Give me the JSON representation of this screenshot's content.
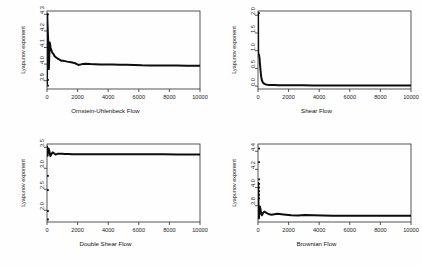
{
  "figure": {
    "layout": "2x2 grid of panels",
    "background_color": "#fefefe",
    "foreground_color": "#1a1a1a"
  },
  "chart_data": [
    {
      "type": "line",
      "title": "",
      "xlabel": "Ornstein-Uhlenbeck Flow",
      "ylabel": "Lyapunov exponent",
      "xlim": [
        0,
        10000
      ],
      "ylim": [
        3.85,
        4.32
      ],
      "xticks": [
        0,
        2000,
        4000,
        6000,
        8000,
        10000
      ],
      "xtick_labels": [
        "0",
        "2000",
        "4000",
        "6000",
        "8000",
        "10000"
      ],
      "yticks": [
        3.9,
        4.0,
        4.1,
        4.2,
        4.3
      ],
      "ytick_labels": [
        "3.9",
        "4.0",
        "4.1",
        "4.2",
        "4.3"
      ],
      "grid": false,
      "legend": "none",
      "x": [
        5,
        12,
        20,
        30,
        45,
        60,
        80,
        100,
        120,
        140,
        160,
        180,
        200,
        230,
        260,
        300,
        340,
        380,
        430,
        480,
        540,
        600,
        680,
        760,
        850,
        950,
        1060,
        1180,
        1320,
        1480,
        1650,
        1850,
        2050,
        2300,
        2550,
        2850,
        3150,
        3500,
        3900,
        4300,
        4750,
        5200,
        5700,
        6200,
        6750,
        7300,
        7900,
        8500,
        9100,
        9700,
        10000
      ],
      "y": [
        3.88,
        4.3,
        4.29,
        4.25,
        4.22,
        4.18,
        4.14,
        4.1,
        3.97,
        4.02,
        4.09,
        4.13,
        4.12,
        4.1,
        4.09,
        4.08,
        4.07,
        4.065,
        4.06,
        4.05,
        4.045,
        4.04,
        4.035,
        4.03,
        4.025,
        4.02,
        4.02,
        4.018,
        4.015,
        4.012,
        4.01,
        4.005,
        3.995,
        4.0,
        4.002,
        4.0,
        3.999,
        3.998,
        3.998,
        3.997,
        3.996,
        3.996,
        3.995,
        3.993,
        3.992,
        3.992,
        3.991,
        3.991,
        3.99,
        3.99,
        3.99
      ],
      "outlier_points": [
        {
          "x": 60,
          "y": 4.3
        },
        {
          "x": 62,
          "y": 3.905
        },
        {
          "x": 64,
          "y": 3.87
        }
      ],
      "description": "Running Lyapunov exponent estimate converging to about 3.99 after a transient spike near 4.3."
    },
    {
      "type": "line",
      "title": "",
      "xlabel": "Shear Flow",
      "ylabel": "Lyapunov exponent",
      "xlim": [
        0,
        10000
      ],
      "ylim": [
        -0.08,
        2.12
      ],
      "xticks": [
        0,
        2000,
        4000,
        6000,
        8000,
        10000
      ],
      "xtick_labels": [
        "0",
        "2000",
        "4000",
        "6000",
        "8000",
        "10000"
      ],
      "yticks": [
        0.0,
        0.5,
        1.0,
        1.5,
        2.0
      ],
      "ytick_labels": [
        "0.0",
        "0.5",
        "1.0",
        "1.5",
        "2.0"
      ],
      "grid": false,
      "legend": "none",
      "x": [
        5,
        15,
        30,
        50,
        75,
        100,
        130,
        170,
        210,
        260,
        320,
        400,
        500,
        620,
        760,
        920,
        1100,
        1320,
        1600,
        1950,
        2400,
        2950,
        3600,
        4300,
        5100,
        5900,
        6800,
        7700,
        8600,
        9400,
        10000
      ],
      "y": [
        2.06,
        0.93,
        0.92,
        0.9,
        0.86,
        0.78,
        0.62,
        0.42,
        0.26,
        0.16,
        0.1,
        0.07,
        0.05,
        0.042,
        0.036,
        0.032,
        0.03,
        0.028,
        0.026,
        0.025,
        0.024,
        0.023,
        0.022,
        0.022,
        0.021,
        0.021,
        0.02,
        0.02,
        0.02,
        0.02,
        0.02
      ],
      "outlier_points": [
        {
          "x": 60,
          "y": 2.06
        }
      ],
      "description": "Sharp decay from about 0.93 to near zero within the first 500 iterations."
    },
    {
      "type": "line",
      "title": "",
      "xlabel": "Double Shear Flow",
      "ylabel": "Lyapunov exponent",
      "xlim": [
        0,
        10000
      ],
      "ylim": [
        1.72,
        3.58
      ],
      "xticks": [
        0,
        2000,
        4000,
        6000,
        8000,
        10000
      ],
      "xtick_labels": [
        "0",
        "2000",
        "4000",
        "6000",
        "8000",
        "10000"
      ],
      "yticks": [
        2.0,
        2.5,
        3.0,
        3.5
      ],
      "ytick_labels": [
        "2.0",
        "2.5",
        "3.0",
        "3.5"
      ],
      "grid": false,
      "legend": "none",
      "x": [
        5,
        20,
        40,
        70,
        110,
        160,
        220,
        290,
        370,
        460,
        560,
        680,
        820,
        980,
        1160,
        1380,
        1650,
        1980,
        2380,
        2850,
        3400,
        4000,
        4650,
        5350,
        6100,
        6900,
        7700,
        8500,
        9300,
        10000
      ],
      "y": [
        3.52,
        3.48,
        3.3,
        3.42,
        3.47,
        3.4,
        3.29,
        3.34,
        3.38,
        3.36,
        3.33,
        3.345,
        3.35,
        3.345,
        3.34,
        3.34,
        3.338,
        3.337,
        3.336,
        3.336,
        3.335,
        3.335,
        3.334,
        3.334,
        3.333,
        3.333,
        3.333,
        3.332,
        3.332,
        3.332
      ],
      "outlier_points": [
        {
          "x": 60,
          "y": 2.82
        },
        {
          "x": 60,
          "y": 2.48
        },
        {
          "x": 60,
          "y": 1.98
        },
        {
          "x": 60,
          "y": 1.78
        }
      ],
      "description": "Damped oscillation settling to about 3.33."
    },
    {
      "type": "line",
      "title": "",
      "xlabel": "Brownian Flow",
      "ylabel": "Lyapunov exponent",
      "xlim": [
        0,
        10000
      ],
      "ylim": [
        3.62,
        4.48
      ],
      "xticks": [
        0,
        2000,
        4000,
        6000,
        8000,
        10000
      ],
      "xtick_labels": [
        "0",
        "2000",
        "4000",
        "6000",
        "8000",
        "10000"
      ],
      "yticks": [
        3.8,
        4.0,
        4.2,
        4.4
      ],
      "ytick_labels": [
        "3.8",
        "4.0",
        "4.2",
        "4.4"
      ],
      "grid": false,
      "legend": "none",
      "x": [
        5,
        18,
        35,
        60,
        90,
        125,
        165,
        210,
        265,
        330,
        410,
        500,
        610,
        740,
        890,
        1070,
        1280,
        1530,
        1830,
        2180,
        2600,
        3080,
        3620,
        4220,
        4880,
        5600,
        6350,
        7150,
        7950,
        8800,
        9500,
        10000
      ],
      "y": [
        4.05,
        3.95,
        3.8,
        3.66,
        3.72,
        3.79,
        3.76,
        3.71,
        3.695,
        3.72,
        3.735,
        3.725,
        3.715,
        3.705,
        3.7,
        3.705,
        3.71,
        3.705,
        3.7,
        3.695,
        3.692,
        3.697,
        3.695,
        3.692,
        3.69,
        3.69,
        3.689,
        3.689,
        3.688,
        3.688,
        3.688,
        3.688
      ],
      "outlier_points": [
        {
          "x": 70,
          "y": 4.43
        },
        {
          "x": 70,
          "y": 4.28
        },
        {
          "x": 70,
          "y": 4.09
        },
        {
          "x": 70,
          "y": 4.04
        },
        {
          "x": 70,
          "y": 4.0
        },
        {
          "x": 70,
          "y": 3.96
        },
        {
          "x": 70,
          "y": 3.92
        },
        {
          "x": 70,
          "y": 3.88
        }
      ],
      "description": "Scattered early estimates collapsing to about 3.69."
    }
  ]
}
